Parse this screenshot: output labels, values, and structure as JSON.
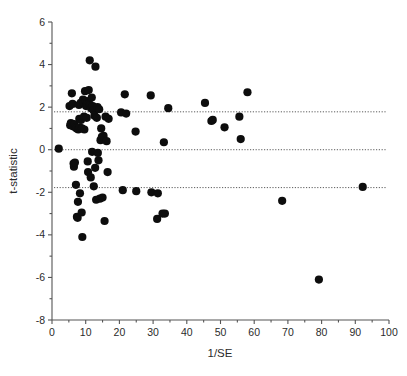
{
  "chart_data": {
    "type": "scatter",
    "title": "",
    "subtitle": "",
    "xlabel": "1/SE",
    "ylabel": "t-statistic",
    "xlim": [
      0,
      100
    ],
    "ylim": [
      -8,
      6
    ],
    "xticks": [
      0,
      10,
      20,
      30,
      40,
      50,
      60,
      70,
      80,
      90,
      100
    ],
    "xtick_labels": [
      "0",
      "10",
      "20",
      "30",
      "40",
      "50",
      "60",
      "70",
      "80",
      "90",
      "100"
    ],
    "yticks": [
      6,
      4,
      2,
      0,
      -2,
      -4,
      -6,
      -8
    ],
    "ytick_labels": [
      "6",
      "4",
      "2",
      "0",
      "-2",
      "-4",
      "-6",
      "-8"
    ],
    "grid": false,
    "legend": null,
    "marker": "filled-circle",
    "marker_color": "#0d0d0d",
    "marker_size_px": 4.1,
    "reference_lines": [
      {
        "name": "upper-significance-line",
        "axis": "horizontal",
        "value": 1.78,
        "style": "dotted",
        "color": "#4a4a4a"
      },
      {
        "name": "zero-line",
        "axis": "horizontal",
        "value": 0.0,
        "style": "dotted",
        "color": "#4a4a4a"
      },
      {
        "name": "lower-significance-line",
        "axis": "horizontal",
        "value": -1.78,
        "style": "dotted",
        "color": "#4a4a4a"
      }
    ],
    "x": [
      2.0,
      5.2,
      5.4,
      5.6,
      5.9,
      6.1,
      6.2,
      6.4,
      6.5,
      6.6,
      6.8,
      7.0,
      7.1,
      7.3,
      7.4,
      7.6,
      7.7,
      7.8,
      8.0,
      8.1,
      8.2,
      8.3,
      8.5,
      8.6,
      8.8,
      8.9,
      9.0,
      9.2,
      9.3,
      9.5,
      9.6,
      9.8,
      10.0,
      10.1,
      10.3,
      10.4,
      10.6,
      10.7,
      10.9,
      11.0,
      11.2,
      11.3,
      11.5,
      11.6,
      11.8,
      11.9,
      12.1,
      12.3,
      12.4,
      12.6,
      12.8,
      12.9,
      13.1,
      13.3,
      13.5,
      13.6,
      13.8,
      14.0,
      14.2,
      14.4,
      14.6,
      14.8,
      15.0,
      15.3,
      15.6,
      15.9,
      16.2,
      16.5,
      16.8,
      20.5,
      21.0,
      21.6,
      22.0,
      24.8,
      25.0,
      29.3,
      29.5,
      31.2,
      31.4,
      32.8,
      33.2,
      33.5,
      34.5,
      45.4,
      47.3,
      47.7,
      51.2,
      55.6,
      56.0,
      58.0,
      68.3,
      79.2,
      92.2
    ],
    "y": [
      0.05,
      2.05,
      1.15,
      1.25,
      2.65,
      2.15,
      1.1,
      -0.65,
      -0.8,
      1.2,
      -0.6,
      1.05,
      -1.65,
      1.0,
      -3.15,
      -3.2,
      -2.45,
      0.95,
      2.1,
      1.45,
      1.05,
      -2.05,
      2.2,
      1.4,
      -2.95,
      1.0,
      -4.1,
      2.35,
      2.2,
      1.55,
      0.95,
      2.75,
      2.3,
      2.05,
      1.5,
      2.15,
      -0.55,
      -1.05,
      2.8,
      2.15,
      4.2,
      2.1,
      -1.3,
      1.95,
      2.45,
      -0.1,
      2.05,
      1.85,
      -1.72,
      1.6,
      -0.85,
      3.9,
      -2.35,
      1.5,
      2.0,
      -0.15,
      -0.5,
      1.9,
      -2.3,
      0.45,
      1.0,
      0.6,
      -2.25,
      0.65,
      -3.35,
      1.55,
      0.4,
      -1.05,
      1.45,
      1.75,
      -1.9,
      2.6,
      1.7,
      0.85,
      -1.95,
      2.55,
      -2.0,
      -3.25,
      -2.05,
      -3.0,
      0.35,
      -3.0,
      1.95,
      2.2,
      1.35,
      1.4,
      1.05,
      1.55,
      0.5,
      2.7,
      -2.4,
      -6.1,
      -1.75
    ],
    "n_points": 93
  },
  "axis": {
    "x_title": "1/SE",
    "y_title": "t-statistic"
  }
}
